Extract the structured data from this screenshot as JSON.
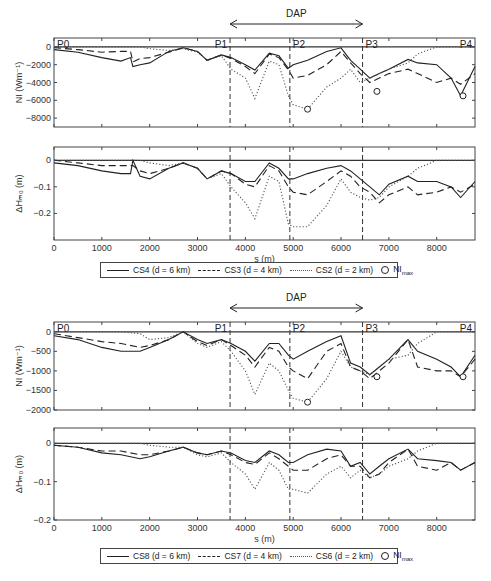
{
  "figure": {
    "dap_label": "DAP",
    "x_axis_label": "s (m)",
    "x_ticks": [
      "0",
      "1000",
      "2000",
      "3000",
      "4000",
      "5000",
      "6000",
      "7000",
      "8000"
    ],
    "profile_points": [
      "P0",
      "P1",
      "P2",
      "P3",
      "P4"
    ],
    "vertical_markers_s": [
      3680,
      4930,
      6450
    ]
  },
  "top_group": {
    "ni_panel": {
      "ylabel": "NI (Wm⁻¹)",
      "yticks": [
        "0",
        "−2000",
        "−4000",
        "−6000",
        "−8000"
      ]
    },
    "dh_panel": {
      "ylabel": "ΔHₘ₀ (m)",
      "yticks": [
        "0",
        "−0.1",
        "−0.2"
      ]
    },
    "legend": {
      "solid": "CS4 (d = 6 km)",
      "dashed": "CS3 (d = 4 km)",
      "dotted": "CS2 (d = 2 km)",
      "marker": "NI",
      "marker_sub": "max"
    }
  },
  "bottom_group": {
    "ni_panel": {
      "ylabel": "NI (Wm⁻¹)",
      "yticks": [
        "0",
        "−500",
        "−1000",
        "−1500",
        "−2000"
      ]
    },
    "dh_panel": {
      "ylabel": "ΔHₘ₀ (m)",
      "yticks": [
        "0",
        "−0.1",
        "−0.2"
      ]
    },
    "legend": {
      "solid": "CS8 (d = 6 km)",
      "dashed": "CS7 (d = 4 km)",
      "dotted": "CS6 (d = 2 km)",
      "marker": "NI",
      "marker_sub": "max"
    }
  },
  "chart_data": [
    {
      "type": "line",
      "title": "NI along profile (CS4, CS3, CS2)",
      "xlabel": "s (m)",
      "ylabel": "NI (Wm^-1)",
      "xlim": [
        0,
        8800
      ],
      "ylim": [
        -9000,
        1000
      ],
      "x": [
        0,
        500,
        1000,
        1400,
        1600,
        1650,
        1800,
        2000,
        2400,
        2700,
        3000,
        3200,
        3500,
        3700,
        4000,
        4200,
        4500,
        4700,
        4900,
        5000,
        5300,
        5700,
        6000,
        6200,
        6400,
        6600,
        6800,
        7000,
        7400,
        7600,
        8000,
        8300,
        8500,
        8800
      ],
      "series": [
        {
          "name": "CS4 (d=6 km)",
          "style": "solid",
          "values": [
            -300,
            -600,
            -1200,
            -1600,
            -1200,
            -2200,
            -2000,
            -1800,
            -500,
            -100,
            -500,
            -1500,
            -900,
            -1200,
            -2000,
            -2600,
            -700,
            -1000,
            -2400,
            -2000,
            -1500,
            -500,
            -100,
            -1500,
            -2500,
            -3500,
            -3000,
            -2500,
            -1400,
            -1800,
            -2000,
            -3500,
            -5500,
            -2200
          ]
        },
        {
          "name": "CS3 (d=4 km)",
          "style": "dashed",
          "values": [
            -100,
            -300,
            -600,
            -500,
            -500,
            -1700,
            -1300,
            -1200,
            -600,
            -100,
            -500,
            -1500,
            -900,
            -1300,
            -2200,
            -3000,
            -800,
            -1200,
            -2600,
            -3500,
            -3200,
            -2000,
            -500,
            -1800,
            -3000,
            -4000,
            -3500,
            -3000,
            -2500,
            -3000,
            -4000,
            -3500,
            -4200,
            -3000
          ]
        },
        {
          "name": "CS2 (d=2 km)",
          "style": "dotted",
          "values": [
            0,
            0,
            0,
            0,
            0,
            0,
            0,
            -200,
            -400,
            -200,
            -600,
            -1500,
            -1000,
            -2500,
            -3500,
            -5800,
            -1600,
            -2000,
            -5500,
            -6500,
            -7000,
            -4500,
            -3500,
            -2500,
            -4000,
            -3500,
            -3000,
            -2500,
            -1800,
            -800,
            0,
            0,
            0,
            0
          ]
        }
      ],
      "ni_max_markers": [
        {
          "s": 5300,
          "value": -7000
        },
        {
          "s": 6750,
          "value": -5000
        },
        {
          "s": 8550,
          "value": -5500
        }
      ],
      "annotations": [
        "P0",
        "P1",
        "P2",
        "P3",
        "P4",
        "DAP"
      ]
    },
    {
      "type": "line",
      "title": "ΔHm0 along profile (CS4, CS3, CS2)",
      "xlabel": "s (m)",
      "ylabel": "ΔHm0 (m)",
      "xlim": [
        0,
        8800
      ],
      "ylim": [
        -0.3,
        0.05
      ],
      "x": [
        0,
        500,
        1000,
        1400,
        1600,
        1650,
        1800,
        2000,
        2400,
        2700,
        3000,
        3200,
        3500,
        3700,
        4000,
        4200,
        4500,
        4700,
        4900,
        5000,
        5300,
        5700,
        6000,
        6200,
        6400,
        6600,
        6800,
        7000,
        7400,
        7600,
        8000,
        8300,
        8500,
        8800
      ],
      "series": [
        {
          "name": "CS4 (d=6 km)",
          "style": "solid",
          "values": [
            -0.01,
            -0.02,
            -0.04,
            -0.05,
            -0.05,
            0.0,
            -0.06,
            -0.07,
            -0.03,
            -0.01,
            -0.03,
            -0.07,
            -0.04,
            -0.05,
            -0.08,
            -0.08,
            -0.01,
            -0.03,
            -0.07,
            -0.07,
            -0.05,
            -0.03,
            -0.02,
            -0.04,
            -0.07,
            -0.1,
            -0.13,
            -0.09,
            -0.06,
            -0.08,
            -0.08,
            -0.1,
            -0.14,
            -0.08
          ]
        },
        {
          "name": "CS3 (d=4 km)",
          "style": "dashed",
          "values": [
            0.0,
            -0.01,
            -0.02,
            -0.02,
            -0.02,
            -0.02,
            -0.04,
            -0.05,
            -0.03,
            -0.01,
            -0.03,
            -0.07,
            -0.04,
            -0.05,
            -0.09,
            -0.1,
            -0.02,
            -0.04,
            -0.1,
            -0.12,
            -0.13,
            -0.08,
            -0.04,
            -0.06,
            -0.1,
            -0.12,
            -0.16,
            -0.13,
            -0.1,
            -0.13,
            -0.12,
            -0.1,
            -0.12,
            -0.09
          ]
        },
        {
          "name": "CS2 (d=2 km)",
          "style": "dotted",
          "values": [
            0,
            0,
            0,
            0,
            0,
            0,
            0,
            -0.01,
            -0.02,
            -0.01,
            -0.03,
            -0.07,
            -0.05,
            -0.1,
            -0.16,
            -0.22,
            -0.06,
            -0.08,
            -0.24,
            -0.25,
            -0.25,
            -0.17,
            -0.07,
            -0.12,
            -0.14,
            -0.15,
            -0.14,
            -0.1,
            -0.06,
            -0.03,
            0,
            0,
            0,
            0
          ]
        }
      ],
      "annotations": [
        "P0",
        "P1",
        "P2",
        "P3",
        "P4"
      ]
    },
    {
      "type": "line",
      "title": "NI along profile (CS8, CS7, CS6)",
      "xlabel": "s (m)",
      "ylabel": "NI (Wm^-1)",
      "xlim": [
        0,
        8800
      ],
      "ylim": [
        -2000,
        250
      ],
      "x": [
        0,
        500,
        1000,
        1400,
        1800,
        2000,
        2400,
        2700,
        3000,
        3200,
        3500,
        3700,
        4000,
        4200,
        4500,
        4700,
        4900,
        5000,
        5300,
        5700,
        6000,
        6200,
        6400,
        6600,
        6800,
        7000,
        7400,
        7600,
        8000,
        8300,
        8500,
        8800
      ],
      "series": [
        {
          "name": "CS8 (d=6 km)",
          "style": "solid",
          "values": [
            -100,
            -200,
            -400,
            -500,
            -500,
            -400,
            -200,
            0,
            -200,
            -300,
            -200,
            -300,
            -500,
            -750,
            -300,
            -300,
            -600,
            -700,
            -500,
            -250,
            -100,
            -800,
            -900,
            -1100,
            -900,
            -700,
            -200,
            -500,
            -700,
            -900,
            -1150,
            -600
          ]
        },
        {
          "name": "CS7 (d=4 km)",
          "style": "dashed",
          "values": [
            -50,
            -150,
            -250,
            -300,
            -400,
            -350,
            -200,
            0,
            -250,
            -350,
            -200,
            -350,
            -600,
            -900,
            -400,
            -500,
            -900,
            -1000,
            -1200,
            -500,
            -300,
            -900,
            -1000,
            -1200,
            -1000,
            -800,
            -200,
            -900,
            -1000,
            -1000,
            -1150,
            -700
          ]
        },
        {
          "name": "CS6 (d=2 km)",
          "style": "dotted",
          "values": [
            0,
            0,
            0,
            0,
            -50,
            -200,
            -150,
            0,
            -300,
            -400,
            -250,
            -500,
            -1000,
            -1600,
            -800,
            -1000,
            -1500,
            -1700,
            -1800,
            -1200,
            -500,
            -900,
            -1000,
            -1100,
            -900,
            -700,
            -600,
            -300,
            0,
            0,
            0,
            0
          ]
        }
      ],
      "ni_max_markers": [
        {
          "s": 5300,
          "value": -1800
        },
        {
          "s": 6750,
          "value": -1150
        },
        {
          "s": 8550,
          "value": -1150
        }
      ],
      "annotations": [
        "P0",
        "P1",
        "P2",
        "P3",
        "P4",
        "DAP"
      ]
    },
    {
      "type": "line",
      "title": "ΔHm0 along profile (CS8, CS7, CS6)",
      "xlabel": "s (m)",
      "ylabel": "ΔHm0 (m)",
      "xlim": [
        0,
        8800
      ],
      "ylim": [
        -0.2,
        0.04
      ],
      "x": [
        0,
        500,
        1000,
        1400,
        1800,
        2000,
        2400,
        2700,
        3000,
        3200,
        3500,
        3700,
        4000,
        4200,
        4500,
        4700,
        4900,
        5000,
        5300,
        5700,
        6000,
        6200,
        6400,
        6600,
        6800,
        7000,
        7400,
        7600,
        8000,
        8300,
        8500,
        8800
      ],
      "series": [
        {
          "name": "CS8 (d=6 km)",
          "style": "solid",
          "values": [
            -0.005,
            -0.01,
            -0.025,
            -0.03,
            -0.04,
            -0.035,
            -0.02,
            -0.01,
            -0.025,
            -0.03,
            -0.02,
            -0.025,
            -0.045,
            -0.05,
            -0.02,
            -0.03,
            -0.05,
            -0.05,
            -0.03,
            -0.015,
            -0.02,
            -0.06,
            -0.05,
            -0.08,
            -0.06,
            -0.04,
            -0.015,
            -0.04,
            -0.045,
            -0.05,
            -0.07,
            -0.05
          ]
        },
        {
          "name": "CS7 (d=4 km)",
          "style": "dashed",
          "values": [
            -0.005,
            -0.01,
            -0.02,
            -0.02,
            -0.03,
            -0.03,
            -0.02,
            -0.01,
            -0.025,
            -0.03,
            -0.02,
            -0.03,
            -0.05,
            -0.055,
            -0.025,
            -0.04,
            -0.06,
            -0.07,
            -0.07,
            -0.04,
            -0.03,
            -0.06,
            -0.06,
            -0.09,
            -0.08,
            -0.05,
            -0.015,
            -0.06,
            -0.07,
            -0.05,
            -0.07,
            -0.05
          ]
        },
        {
          "name": "CS6 (d=2 km)",
          "style": "dotted",
          "values": [
            0,
            0,
            0,
            0,
            0,
            -0.005,
            -0.01,
            -0.01,
            -0.03,
            -0.035,
            -0.025,
            -0.05,
            -0.08,
            -0.12,
            -0.05,
            -0.07,
            -0.12,
            -0.12,
            -0.13,
            -0.08,
            -0.06,
            -0.09,
            -0.07,
            -0.09,
            -0.08,
            -0.06,
            -0.04,
            -0.02,
            0,
            0,
            0,
            0
          ]
        }
      ],
      "annotations": []
    }
  ]
}
